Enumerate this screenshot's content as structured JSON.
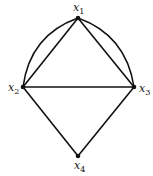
{
  "diagram": {
    "type": "multigraph",
    "nodes": [
      {
        "id": "x1",
        "label": "x",
        "sub": "1",
        "x": 78,
        "y": 18
      },
      {
        "id": "x2",
        "label": "x",
        "sub": "2",
        "x": 23,
        "y": 87
      },
      {
        "id": "x3",
        "label": "x",
        "sub": "3",
        "x": 134,
        "y": 87
      },
      {
        "id": "x4",
        "label": "x",
        "sub": "4",
        "x": 78,
        "y": 156
      }
    ],
    "edges": [
      {
        "from": "x1",
        "to": "x2",
        "kind": "straight"
      },
      {
        "from": "x1",
        "to": "x2",
        "kind": "curved"
      },
      {
        "from": "x1",
        "to": "x3",
        "kind": "straight"
      },
      {
        "from": "x1",
        "to": "x3",
        "kind": "curved"
      },
      {
        "from": "x2",
        "to": "x3",
        "kind": "straight"
      },
      {
        "from": "x2",
        "to": "x4",
        "kind": "straight"
      },
      {
        "from": "x3",
        "to": "x4",
        "kind": "straight"
      }
    ],
    "colors": {
      "edge": "#111111",
      "node": "#111111"
    }
  }
}
